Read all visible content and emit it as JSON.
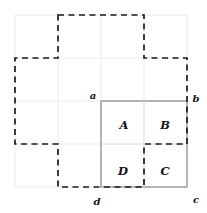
{
  "figure": {
    "canvas": {
      "width": 207,
      "height": 213,
      "background": "#ffffff"
    },
    "colors": {
      "grid": "#ebebeb",
      "dashed_outline": "#1a1a1a",
      "solid_square": "#8d8d8d",
      "inner_divider": "#e2e2e2",
      "label_text": "#141414"
    },
    "grid": {
      "visible": true,
      "columns": 4,
      "rows": 4,
      "x0": 15,
      "y0": 15,
      "cell_width": 43,
      "cell_height": 43,
      "vertical_x": [
        15,
        58,
        101,
        144,
        187
      ],
      "horizontal_y": [
        15,
        58,
        101,
        144,
        187
      ]
    },
    "corner_labels": [
      {
        "id": "a",
        "text": "a",
        "x": 93,
        "y": 96
      },
      {
        "id": "b",
        "text": "b",
        "x": 196,
        "y": 99
      },
      {
        "id": "c",
        "text": "c",
        "x": 196,
        "y": 200
      },
      {
        "id": "d",
        "text": "d",
        "x": 97,
        "y": 202
      }
    ],
    "cell_labels": [
      {
        "id": "A",
        "text": "A",
        "x": 124,
        "y": 126
      },
      {
        "id": "B",
        "text": "B",
        "x": 165,
        "y": 126
      },
      {
        "id": "C",
        "text": "C",
        "x": 165,
        "y": 172
      },
      {
        "id": "D",
        "text": "D",
        "x": 123,
        "y": 172
      }
    ],
    "square": {
      "name": "labeled-square-abcd",
      "x": 101,
      "y": 101,
      "width": 86,
      "height": 86,
      "divider_vertical_x": 144,
      "divider_horizontal_y": 144
    },
    "dashed_path": "M 58 15 L 144 15 L 144 58 L 187 58 L 187 144 L 144 144 L 144 187 L 58 187 L 58 144 L 15 144 L 15 58 L 58 58 Z",
    "shape_description": "plus-shaped cross polyomino outlined with dashed strokes"
  }
}
